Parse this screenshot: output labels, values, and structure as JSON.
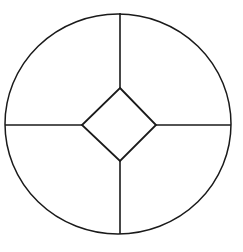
{
  "diagram": {
    "stroke_color": "#1a1a1a",
    "background": "#ffffff",
    "circle": {
      "cx": 118,
      "cy": 124,
      "rx": 113,
      "ry": 110
    },
    "diamond": {
      "top": [
        120,
        88
      ],
      "right": [
        156,
        125
      ],
      "bottom": [
        120,
        161
      ],
      "left": [
        82,
        125
      ]
    },
    "spokes": [
      {
        "name": "top",
        "from": [
          120,
          13
        ],
        "to": [
          120,
          88
        ]
      },
      {
        "name": "right",
        "from": [
          156,
          125
        ],
        "to": [
          231,
          125
        ]
      },
      {
        "name": "bottom",
        "from": [
          120,
          161
        ],
        "to": [
          120,
          234
        ]
      },
      {
        "name": "left",
        "from": [
          5,
          125
        ],
        "to": [
          82,
          125
        ]
      }
    ]
  }
}
